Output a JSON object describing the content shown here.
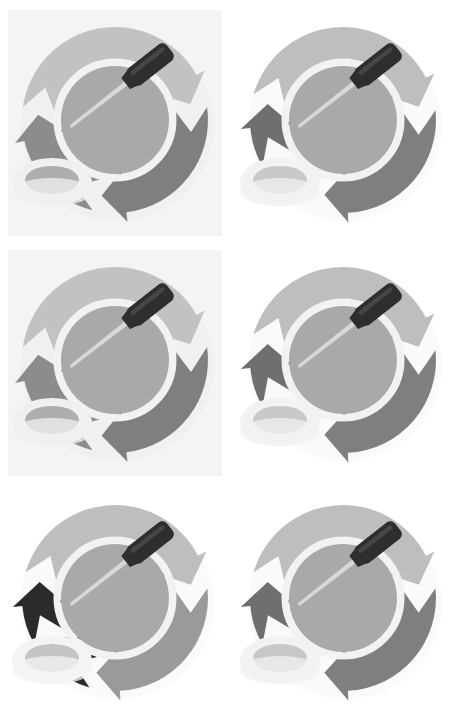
{
  "image": {
    "title": "Maintenance Cycle Icon Set",
    "description": "Six grayscale circular-arrow maintenance icons arranged in a 2 column by 3 row grid",
    "width": 458,
    "height": 723,
    "background_color": "#ffffff",
    "grid": {
      "columns": 2,
      "rows": 3,
      "total_panels": 6
    }
  },
  "palette": {
    "page_background": "#ffffff",
    "panel_tint_background": "#f6f6f6",
    "ring_light": "#c2c2c2",
    "ring_mid": "#b5b5b5",
    "ring_dark": "#7f7f7f",
    "ring_black": "#2b2b2b",
    "inner_disc": "#a9a9a9",
    "inner_gap": "#f2f2f2",
    "tool_handle": "#2e2e2e",
    "tool_handle_highlight": "#4a4a4a",
    "tool_shaft": "#dcdcdc",
    "oval_fill": "#aeaeae",
    "oval_rim": "#f0f0f0",
    "shadow": "#d8d8d8"
  },
  "panels": [
    {
      "id": "panel-1",
      "name": "cycle-icon-top-left",
      "row": 1,
      "column": 1,
      "x": 8,
      "y": 10,
      "width": 214,
      "height": 226,
      "has_tint_background": true,
      "tint_color": "#f4f4f4",
      "segments": [
        {
          "name": "segment-upper-left",
          "color": "#c2c2c2",
          "start_deg": 188,
          "end_deg": 348
        },
        {
          "name": "segment-right",
          "color": "#7f7f7f",
          "start_deg": 352,
          "end_deg": 100
        },
        {
          "name": "segment-lower",
          "color": "#8c8c8c",
          "start_deg": 104,
          "end_deg": 184
        }
      ],
      "inner_disc_color": "#a9a9a9",
      "tool": {
        "name": "screwdriver",
        "handle_color": "#2e2e2e",
        "angle_deg": -38
      },
      "oval": {
        "name": "pivot-oval",
        "fill": "#aeaeae",
        "rim": "#f0f0f0"
      }
    },
    {
      "id": "panel-2",
      "name": "cycle-icon-top-right",
      "row": 1,
      "column": 2,
      "x": 236,
      "y": 10,
      "width": 214,
      "height": 226,
      "has_tint_background": false,
      "tint_color": "#ffffff",
      "segments": [
        {
          "name": "segment-upper-left",
          "color": "#bebebe",
          "start_deg": 196,
          "end_deg": 350
        },
        {
          "name": "segment-right",
          "color": "#7f7f7f",
          "start_deg": 354,
          "end_deg": 104
        },
        {
          "name": "segment-lower-left",
          "color": "#6f6f6f",
          "start_deg": 150,
          "end_deg": 192
        }
      ],
      "inner_disc_color": "#a9a9a9",
      "tool": {
        "name": "screwdriver",
        "handle_color": "#2e2e2e",
        "angle_deg": -38
      },
      "oval": {
        "name": "pivot-oval",
        "fill": "#c8c8c8",
        "rim": "#f2f2f2"
      }
    },
    {
      "id": "panel-3",
      "name": "cycle-icon-middle-left",
      "row": 2,
      "column": 1,
      "x": 8,
      "y": 250,
      "width": 214,
      "height": 226,
      "has_tint_background": true,
      "tint_color": "#f4f4f4",
      "segments": [
        {
          "name": "segment-upper-left",
          "color": "#c2c2c2",
          "start_deg": 188,
          "end_deg": 348
        },
        {
          "name": "segment-right",
          "color": "#7f7f7f",
          "start_deg": 352,
          "end_deg": 100
        },
        {
          "name": "segment-lower",
          "color": "#8c8c8c",
          "start_deg": 104,
          "end_deg": 184
        }
      ],
      "inner_disc_color": "#a9a9a9",
      "tool": {
        "name": "screwdriver",
        "handle_color": "#2e2e2e",
        "angle_deg": -38
      },
      "oval": {
        "name": "pivot-oval",
        "fill": "#aeaeae",
        "rim": "#f0f0f0"
      }
    },
    {
      "id": "panel-4",
      "name": "cycle-icon-middle-right",
      "row": 2,
      "column": 2,
      "x": 236,
      "y": 250,
      "width": 214,
      "height": 226,
      "has_tint_background": false,
      "tint_color": "#ffffff",
      "segments": [
        {
          "name": "segment-upper-left",
          "color": "#bebebe",
          "start_deg": 196,
          "end_deg": 350
        },
        {
          "name": "segment-right",
          "color": "#7f7f7f",
          "start_deg": 354,
          "end_deg": 104
        },
        {
          "name": "segment-lower-left",
          "color": "#6f6f6f",
          "start_deg": 150,
          "end_deg": 192
        }
      ],
      "inner_disc_color": "#a9a9a9",
      "tool": {
        "name": "screwdriver",
        "handle_color": "#2e2e2e",
        "angle_deg": -38
      },
      "oval": {
        "name": "pivot-oval",
        "fill": "#c8c8c8",
        "rim": "#f2f2f2"
      }
    },
    {
      "id": "panel-5",
      "name": "cycle-icon-bottom-left",
      "row": 3,
      "column": 1,
      "x": 8,
      "y": 488,
      "width": 214,
      "height": 226,
      "has_tint_background": false,
      "tint_color": "#ffffff",
      "segments": [
        {
          "name": "segment-upper-left",
          "color": "#bebebe",
          "start_deg": 196,
          "end_deg": 350
        },
        {
          "name": "segment-right",
          "color": "#9a9a9a",
          "start_deg": 354,
          "end_deg": 104
        },
        {
          "name": "segment-lower-left",
          "color": "#2b2b2b",
          "start_deg": 150,
          "end_deg": 192
        },
        {
          "name": "segment-bottom",
          "color": "#2b2b2b",
          "start_deg": 106,
          "end_deg": 148
        }
      ],
      "inner_disc_color": "#a9a9a9",
      "tool": {
        "name": "screwdriver",
        "handle_color": "#2e2e2e",
        "angle_deg": -38
      },
      "oval": {
        "name": "pivot-oval",
        "fill": "#c4c4c4",
        "rim": "#f4f4f4"
      }
    },
    {
      "id": "panel-6",
      "name": "cycle-icon-bottom-right",
      "row": 3,
      "column": 2,
      "x": 236,
      "y": 488,
      "width": 214,
      "height": 226,
      "has_tint_background": false,
      "tint_color": "#ffffff",
      "segments": [
        {
          "name": "segment-upper-left",
          "color": "#bebebe",
          "start_deg": 196,
          "end_deg": 350
        },
        {
          "name": "segment-right",
          "color": "#7f7f7f",
          "start_deg": 354,
          "end_deg": 104
        },
        {
          "name": "segment-lower-left",
          "color": "#6f6f6f",
          "start_deg": 150,
          "end_deg": 192
        }
      ],
      "inner_disc_color": "#a9a9a9",
      "tool": {
        "name": "screwdriver",
        "handle_color": "#2e2e2e",
        "angle_deg": -38
      },
      "oval": {
        "name": "pivot-oval",
        "fill": "#c8c8c8",
        "rim": "#f2f2f2"
      }
    }
  ]
}
